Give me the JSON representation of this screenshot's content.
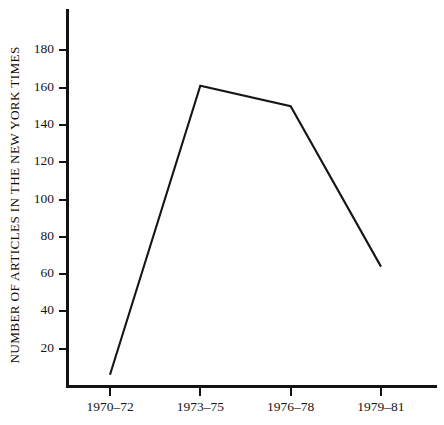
{
  "chart_data": {
    "type": "line",
    "title": "",
    "subtitle": "",
    "xlabel": "",
    "ylabel": "NUMBER OF ARTICLES IN THE NEW YORK TIMES",
    "categories": [
      "1970–72",
      "1973–75",
      "1976–78",
      "1979–81"
    ],
    "values": [
      6,
      161,
      150,
      64
    ],
    "series": [
      {
        "name": "Number of articles in The New York Times",
        "values": [
          6,
          161,
          150,
          64
        ]
      }
    ],
    "ylim": [
      0,
      190
    ],
    "xlim": [
      0,
      4
    ],
    "yticks": [
      20,
      40,
      60,
      80,
      100,
      120,
      140,
      160,
      180
    ],
    "ytick_labels": [
      "20",
      "40",
      "60",
      "80",
      "100",
      "120",
      "140",
      "160",
      "180"
    ],
    "xtick_labels": [
      "1970–72",
      "1973–75",
      "1976–78",
      "1979–81"
    ],
    "grid": false,
    "legend": false,
    "legend_position": "none",
    "line_color": "#151515",
    "background_color": "#ffffff",
    "axis_color": "#121212",
    "annotations": []
  },
  "axes": {
    "y_title": "NUMBER OF ARTICLES IN THE NEW YORK TIMES",
    "y_ticks": [
      {
        "value": 180,
        "label": "180"
      },
      {
        "value": 160,
        "label": "160"
      },
      {
        "value": 140,
        "label": "140"
      },
      {
        "value": 120,
        "label": "120"
      },
      {
        "value": 100,
        "label": "100"
      },
      {
        "value": 80,
        "label": "80"
      },
      {
        "value": 60,
        "label": "60"
      },
      {
        "value": 40,
        "label": "40"
      },
      {
        "value": 20,
        "label": "20"
      }
    ],
    "x_ticks": [
      {
        "label": "1970–72"
      },
      {
        "label": "1973–75"
      },
      {
        "label": "1976–78"
      },
      {
        "label": "1979–81"
      }
    ]
  }
}
